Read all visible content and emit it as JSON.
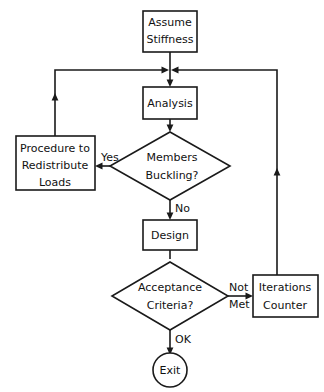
{
  "diagram": {
    "canvas": {
      "width": 324,
      "height": 392
    },
    "colors": {
      "background": "#ffffff",
      "stroke": "#1a1a1a",
      "text": "#111111",
      "shape_fill": "#ffffff"
    }
  },
  "nodes": {
    "assume_stiffness": {
      "shape": "rectangle",
      "line1": "Assume",
      "line2": "Stiffness"
    },
    "analysis": {
      "shape": "rectangle",
      "line1": "Analysis"
    },
    "members_buckling": {
      "shape": "diamond",
      "line1": "Members",
      "line2": "Buckling?"
    },
    "procedure_redistribute": {
      "shape": "rectangle",
      "line1": "Procedure to",
      "line2": "Redistribute",
      "line3": "Loads"
    },
    "design": {
      "shape": "rectangle",
      "line1": "Design"
    },
    "acceptance_criteria": {
      "shape": "diamond",
      "line1": "Acceptance",
      "line2": "Criteria?"
    },
    "iterations_counter": {
      "shape": "rectangle",
      "line1": "Iterations",
      "line2": "Counter"
    },
    "exit": {
      "shape": "circle",
      "line1": "Exit"
    }
  },
  "edge_labels": {
    "yes": "Yes",
    "no": "No",
    "not_met_line1": "Not",
    "not_met_line2": "Met",
    "ok": "OK"
  }
}
